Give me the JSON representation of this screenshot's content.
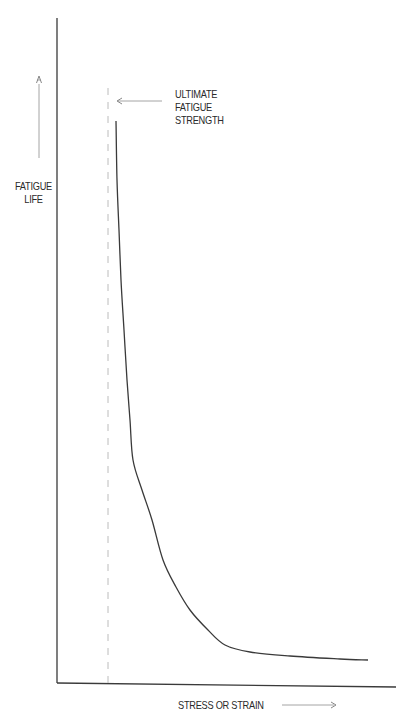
{
  "top_caption_fragment": "Fatigue Life Curve",
  "chart_data": {
    "type": "line",
    "title": "",
    "xlabel": "STRESS OR STRAIN",
    "ylabel": "FATIGUE LIFE",
    "grid": false,
    "legend": null,
    "x_ticks": [],
    "y_ticks": [],
    "annotations": [
      {
        "text": "ULTIMATE FATIGUE STRENGTH",
        "type": "arrow-left-to-dashed-line"
      },
      {
        "text": "",
        "type": "dashed-vertical-asymptote"
      },
      {
        "text": "",
        "type": "arrow-up-beside-ylabel"
      },
      {
        "text": "",
        "type": "arrow-right-beside-xlabel"
      }
    ],
    "series": [
      {
        "name": "fatigue-curve",
        "description": "Qualitative S-N style curve: very high fatigue life near ultimate fatigue strength, decaying steeply then leveling to an asymptote as stress/strain increases",
        "points_px": [
          [
            116,
            121
          ],
          [
            117,
            180
          ],
          [
            119,
            230
          ],
          [
            121,
            280
          ],
          [
            124,
            330
          ],
          [
            127,
            380
          ],
          [
            130,
            420
          ],
          [
            133,
            460
          ],
          [
            142,
            490
          ],
          [
            152,
            520
          ],
          [
            163,
            560
          ],
          [
            176,
            587
          ],
          [
            190,
            610
          ],
          [
            208,
            630
          ],
          [
            225,
            645
          ],
          [
            250,
            652
          ],
          [
            290,
            656
          ],
          [
            340,
            659
          ],
          [
            368,
            660
          ]
        ]
      }
    ]
  },
  "labels": {
    "y_axis_line1": "FATIGUE",
    "y_axis_line2": "LIFE",
    "annotation_line1": "ULTIMATE",
    "annotation_line2": "FATIGUE",
    "annotation_line3": "STRENGTH",
    "x_axis": "STRESS OR STRAIN"
  },
  "colors": {
    "axis": "#333333",
    "curve": "#3a3a3a",
    "dashed": "#bbbbbb",
    "arrow": "#888888",
    "text": "#2a2a2a"
  }
}
